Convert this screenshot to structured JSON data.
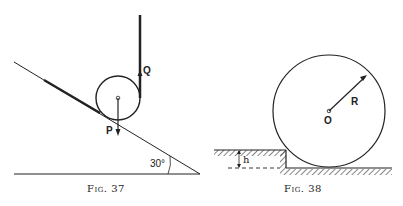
{
  "figures": [
    {
      "caption": "Fig. 37",
      "labels": {
        "force_q": "Q",
        "force_p": "P",
        "angle": "30°"
      }
    },
    {
      "caption": "Fig. 38",
      "labels": {
        "radius": "R",
        "center": "O",
        "height": "h"
      }
    }
  ]
}
